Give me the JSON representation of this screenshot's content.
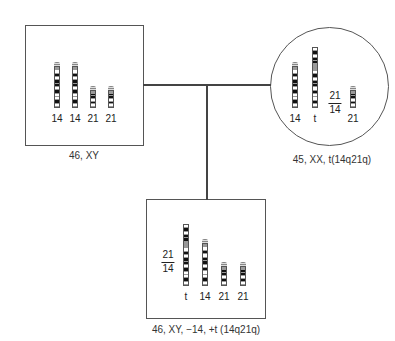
{
  "diagram": {
    "type": "pedigree-karyotype",
    "father": {
      "shape": "square",
      "chromosomes": [
        {
          "label": "14",
          "type": "chr14"
        },
        {
          "label": "14",
          "type": "chr14"
        },
        {
          "label": "21",
          "type": "chr21"
        },
        {
          "label": "21",
          "type": "chr21"
        }
      ],
      "karyotype": "46, XY"
    },
    "mother": {
      "shape": "circle",
      "chromosomes": [
        {
          "label": "14",
          "type": "chr14"
        },
        {
          "label": "t",
          "type": "translocation"
        },
        {
          "label": "21",
          "type": "chr21"
        }
      ],
      "translocation_fraction": {
        "numerator": "21",
        "denominator": "14"
      },
      "karyotype": "45, XX, t(14q21q)"
    },
    "child": {
      "shape": "square",
      "chromosomes": [
        {
          "label": "t",
          "type": "translocation"
        },
        {
          "label": "14",
          "type": "chr14"
        },
        {
          "label": "21",
          "type": "chr21"
        },
        {
          "label": "21",
          "type": "chr21"
        }
      ],
      "translocation_fraction": {
        "numerator": "21",
        "denominator": "14"
      },
      "karyotype": "46, XY, −14, +t (14q21q)"
    }
  }
}
